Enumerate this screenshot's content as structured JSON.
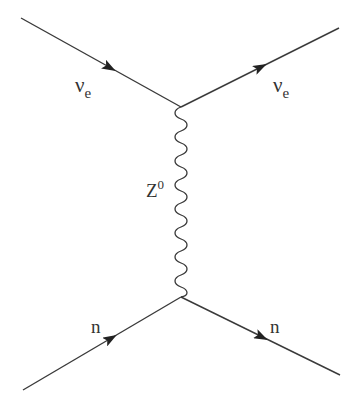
{
  "diagram": {
    "type": "feynman",
    "process": "neutral current neutrino-neutron scattering",
    "colors": {
      "line": "#3a3a3a",
      "background": "#ffffff"
    },
    "vertices": [
      {
        "id": "top",
        "x": 181,
        "y": 107
      },
      {
        "id": "bottom",
        "x": 181,
        "y": 297
      }
    ],
    "particles": [
      {
        "id": "nu-in",
        "label": "ν",
        "sub": "e",
        "from": [
          21,
          18
        ],
        "to": [
          181,
          107
        ],
        "arrow": "forward"
      },
      {
        "id": "nu-out",
        "label": "ν",
        "sub": "e",
        "from": [
          181,
          107
        ],
        "to": [
          339,
          28
        ],
        "arrow": "forward"
      },
      {
        "id": "n-in",
        "label": "n",
        "from": [
          23,
          390
        ],
        "to": [
          181,
          297
        ],
        "arrow": "forward"
      },
      {
        "id": "n-out",
        "label": "n",
        "from": [
          181,
          297
        ],
        "to": [
          340,
          375
        ],
        "arrow": "forward"
      }
    ],
    "propagator": {
      "label": "Z",
      "sup": "0",
      "style": "wavy"
    }
  },
  "labels": {
    "nu_in": "ν",
    "nu_in_sub": "e",
    "nu_out": "ν",
    "nu_out_sub": "e",
    "boson": "Z",
    "boson_sup": "0",
    "n_in": "n",
    "n_out": "n"
  }
}
